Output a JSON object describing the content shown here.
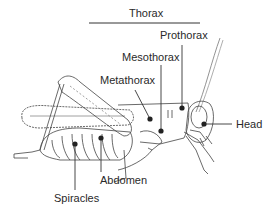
{
  "diagram": {
    "title": "Thorax",
    "labels": {
      "thorax": "Thorax",
      "prothorax": "Prothorax",
      "mesothorax": "Mesothorax",
      "metathorax": "Metathorax",
      "head": "Head",
      "abdomen": "Abdomen",
      "spiracles": "Spiracles"
    },
    "colors": {
      "line": "#333333",
      "dot": "#222222",
      "background": "#ffffff",
      "text": "#2a2a2a"
    }
  }
}
